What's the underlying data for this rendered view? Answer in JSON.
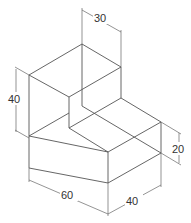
{
  "figure": {
    "type": "isometric L-shaped block drawing",
    "dimensions": [
      {
        "id": "top_width",
        "label": "30"
      },
      {
        "id": "height_total",
        "label": "40"
      },
      {
        "id": "height_step",
        "label": "20"
      },
      {
        "id": "length",
        "label": "60"
      },
      {
        "id": "depth",
        "label": "40"
      }
    ]
  }
}
